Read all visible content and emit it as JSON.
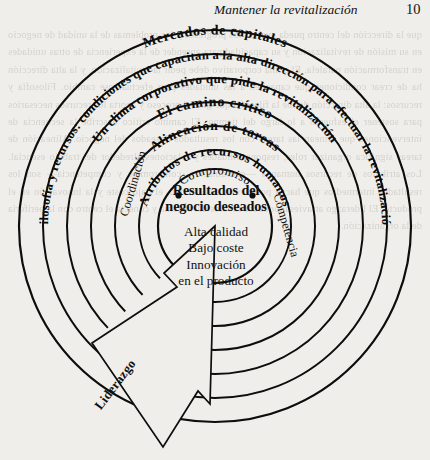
{
  "page": {
    "running_head": "Mantener la revitalización",
    "page_number": "10",
    "background_noise": "que la dirección del centro pueda evaluar los progresos y los problemas de la unidad de negocio en su misión de revitalización y su capacidad para aprender de la experiencia de otras unidades en transformación paralela. El clima corporativo debe pedir la revitalización, y la alta dirección ha de crear condiciones que capaciten a las unidades para efectuar ese cambio. Filosofía y recursos: la alta dirección define la filosofía que guía el proceso y aporta los recursos necesarios para sostener el esfuerzo a lo largo del tiempo. El camino crítico describe la secuencia de intervenciones que alinean las tareas con los resultados deseados del negocio. Alineación de tareas significa organizar roles, responsabilidades y relaciones alrededor del trabajo esencial. Los atributos de recursos humanos —coordinación, compromiso y competencia— son los resultados intermedios que hacen posibles la alta calidad, el bajo coste y la innovación en el producto. El liderazgo atraviesa todos los niveles del sistema y conecta el centro con la periferia de la organización."
  },
  "figure": {
    "name": "circulos-concentricos-revitalizacion",
    "center": {
      "x": 215,
      "y": 226
    },
    "stroke_color": "#0d0d0d",
    "background_color": "#efeeea",
    "rings": [
      {
        "id": "ring-1",
        "radius": 196,
        "label": "Mercados de capitales",
        "style": "bold"
      },
      {
        "id": "ring-2",
        "radius": 172,
        "label": "Filosofía y recursos: condiciones que capacitan a la alta dirección para efectuar la revitalización",
        "style": "bold"
      },
      {
        "id": "ring-3",
        "radius": 148,
        "label": "Un clima corporativo que pide la revitalización",
        "style": "bold"
      },
      {
        "id": "ring-4",
        "radius": 124,
        "label": "El camino crítico",
        "style": "bold"
      },
      {
        "id": "ring-5",
        "radius": 100,
        "label": "Alineación de tareas",
        "style": "bold"
      },
      {
        "id": "ring-6",
        "radius": 76,
        "label": "Atributos de recursos humanos",
        "style": "bold"
      },
      {
        "id": "ring-7",
        "radius": 57,
        "label": "",
        "style": "bold"
      }
    ],
    "attribute_labels": {
      "top": "Compromiso",
      "left": "Coordinación",
      "right": "Competencia"
    },
    "center_block": {
      "heading_line_1": "Resultados del",
      "heading_line_2": "negocio deseados",
      "body_lines": [
        "Alta calidad",
        "Bajo coste",
        "Innovación",
        "en el producto"
      ]
    },
    "wedge": {
      "label": "Liderazgo",
      "description": "cuña-flecha que apunta desde el centro hacia fuera por la parte inferior izquierda"
    }
  }
}
